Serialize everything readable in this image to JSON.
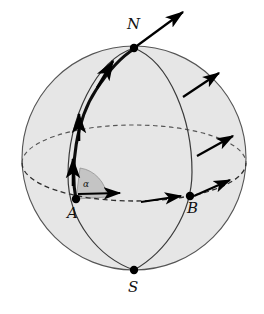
{
  "figure": {
    "background_color": "#ffffff",
    "sphere": {
      "fill_color": "#e6e6e6",
      "stroke_color": "#555555",
      "center_x": 134,
      "center_y": 158,
      "radius": 112
    },
    "wedge": {
      "fill_color": "#c4c4c4",
      "stroke_color": "#777777"
    },
    "curve_color": "#2a2a2a",
    "arc_color": "#000000",
    "arrow_color": "#000000",
    "dash_color": "#444444"
  },
  "labels": {
    "north_pole": "N",
    "south_pole": "S",
    "point_a": "A",
    "point_b": "B",
    "angle": "α"
  },
  "points": [
    {
      "name": "north-pole",
      "label": "N",
      "x": 134,
      "y": 48
    },
    {
      "name": "south-pole",
      "label": "S",
      "x": 134,
      "y": 270
    },
    {
      "name": "point-a",
      "label": "A",
      "x": 76,
      "y": 199
    },
    {
      "name": "point-b",
      "label": "B",
      "x": 190,
      "y": 196
    }
  ],
  "vectors": [
    {
      "name": "north-pole-tangent-arrow",
      "from": [
        134,
        48
      ],
      "to": [
        183,
        12
      ]
    },
    {
      "name": "arc-tangent-arrow-upper",
      "from": [
        97,
        88
      ],
      "to": [
        113,
        61
      ]
    },
    {
      "name": "arc-tangent-arrow-middle",
      "from": [
        79,
        140
      ],
      "to": [
        79,
        114
      ]
    },
    {
      "name": "arc-tangent-arrow-lower",
      "from": [
        73,
        185
      ],
      "to": [
        73,
        159
      ]
    },
    {
      "name": "equator-tangent-arrow-at-a",
      "from": [
        78,
        194
      ],
      "to": [
        121,
        193
      ]
    },
    {
      "name": "equator-tangent-arrow-mid",
      "from": [
        141,
        202
      ],
      "to": [
        182,
        196
      ]
    },
    {
      "name": "meridian-normal-arrow-upper",
      "from": [
        183,
        97
      ],
      "to": [
        220,
        73
      ]
    },
    {
      "name": "meridian-normal-arrow-middle",
      "from": [
        197,
        156
      ],
      "to": [
        234,
        136
      ]
    },
    {
      "name": "meridian-normal-arrow-lower",
      "from": [
        194,
        196
      ],
      "to": [
        231,
        180
      ]
    }
  ],
  "elements": {
    "equator": "dashed-ellipse",
    "meridian_a": "solid-arc-north-to-south-through-a",
    "meridian_b": "solid-arc-north-to-south-through-b",
    "great_circle_arc": "thick-arc-from-a-to-north-pole"
  }
}
